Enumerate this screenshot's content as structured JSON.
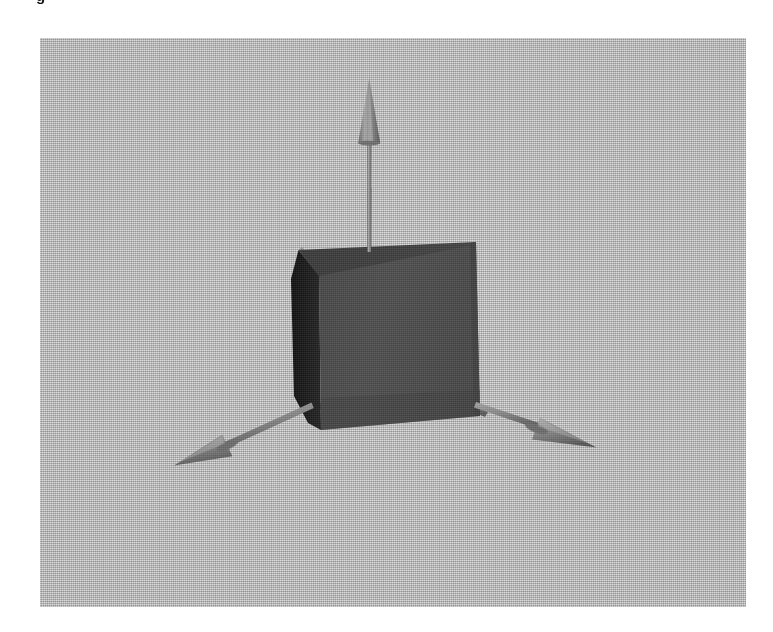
{
  "document": {
    "caption_remnant": "g",
    "page_background": "#ffffff"
  },
  "figure": {
    "panel": {
      "x": 40,
      "y": 38,
      "width": 706,
      "height": 569,
      "background_color": "#b9b9b9",
      "texture": "scanned-halftone-dither"
    },
    "scene": {
      "description": "3D rendered cube with three coordinate axis arrows",
      "objects": [
        {
          "name": "cube",
          "kind": "box",
          "faces": [
            {
              "name": "front-face",
              "color": "#4d4d4d"
            },
            {
              "name": "left-face",
              "color": "#1c1c1c"
            },
            {
              "name": "top-face",
              "color": "#3f3f3f"
            }
          ],
          "front_face_polygon": "257,210 435,202 440,378 280,392",
          "left_face_polygon": "257,210 280,392 268,384 251,238",
          "top_edge_highlight": "257,210 435,202"
        },
        {
          "name": "axis-arrow-up",
          "kind": "arrow",
          "color": "#8e8e8e",
          "tip": [
            325,
            40
          ],
          "tail": [
            329,
            212
          ],
          "head_base_y": 104,
          "shaft_width": 4,
          "head_width": 22,
          "direction": "up"
        },
        {
          "name": "axis-arrow-left",
          "kind": "arrow",
          "color": "#8c8c8c",
          "tip": [
            134,
            427
          ],
          "tail": [
            290,
            372
          ],
          "head_base": [
            186,
            408
          ],
          "shaft_width": 5,
          "head_width": 23,
          "direction": "down-left"
        },
        {
          "name": "axis-arrow-right",
          "kind": "arrow",
          "color": "#8c8c8c",
          "tip": [
            556,
            409
          ],
          "tail": [
            430,
            367
          ],
          "head_base": [
            503,
            391
          ],
          "shaft_width": 5,
          "head_width": 23,
          "direction": "down-right"
        }
      ]
    }
  },
  "colors": {
    "page": "#ffffff",
    "panel_gray": "#b9b9b9",
    "cube_front": "#4d4d4d",
    "cube_side": "#1c1c1c",
    "cube_top": "#3f3f3f",
    "arrow_gray": "#8e8e8e",
    "arrow_shadow": "#6a6a6a",
    "arrow_highlight": "#ababab"
  }
}
